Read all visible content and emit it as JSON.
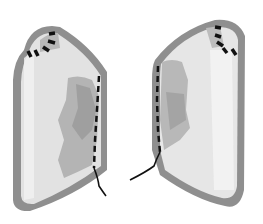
{
  "figure": {
    "colors": {
      "background": "#ffffff",
      "outline": "#8f8f8f",
      "fill_light": "#e2e2e2",
      "fill_mid": "#c4c4c4",
      "fill_dark": "#a3a3a3",
      "highlight": "#f4f4f4",
      "suture": "#111111"
    },
    "panels": [
      {
        "id": "left",
        "side": "left"
      },
      {
        "id": "right",
        "side": "right"
      }
    ]
  }
}
